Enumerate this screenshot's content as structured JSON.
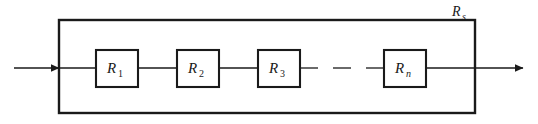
{
  "figure": {
    "background_color": "#ffffff",
    "line_color": "#1a1a1a",
    "box_fill": "#ffffff"
  },
  "outer_box": {
    "label_base": "R",
    "label_subscript": "s",
    "label_full": "Rs",
    "x": 59,
    "y": 20,
    "width": 416,
    "height": 93
  },
  "wire": {
    "y": 68,
    "input_arrow_label": "input",
    "output_arrow_label": "output"
  },
  "ellipsis": {
    "symbol": "—",
    "between": "R3 and Rn"
  },
  "resistors": [
    {
      "base": "R",
      "subscript": "1",
      "full": "R1",
      "x": 96,
      "y": 50,
      "width": 42,
      "height": 37,
      "sub_italic": false
    },
    {
      "base": "R",
      "subscript": "2",
      "full": "R2",
      "x": 177,
      "y": 50,
      "width": 42,
      "height": 37,
      "sub_italic": false
    },
    {
      "base": "R",
      "subscript": "3",
      "full": "R3",
      "x": 258,
      "y": 50,
      "width": 42,
      "height": 37,
      "sub_italic": false
    },
    {
      "base": "R",
      "subscript": "n",
      "full": "Rn",
      "x": 384,
      "y": 50,
      "width": 42,
      "height": 37,
      "sub_italic": true
    }
  ]
}
